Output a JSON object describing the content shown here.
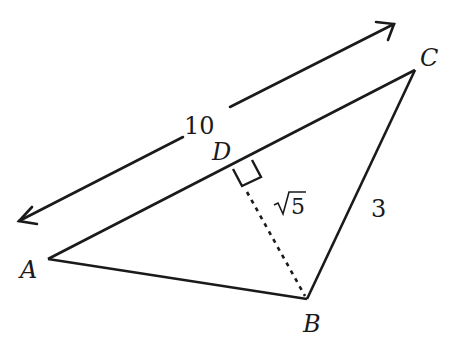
{
  "diagram": {
    "type": "geometry-triangle",
    "colors": {
      "stroke": "#1a1a1a",
      "background": "#ffffff"
    },
    "points": {
      "A": {
        "label": "A",
        "x": 48,
        "y": 259
      },
      "B": {
        "label": "B",
        "x": 307,
        "y": 299
      },
      "C": {
        "label": "C",
        "x": 415,
        "y": 70
      },
      "D": {
        "label": "D",
        "x": 236,
        "y": 167
      }
    },
    "segments": [
      {
        "from": "A",
        "to": "C",
        "style": "solid"
      },
      {
        "from": "A",
        "to": "B",
        "style": "solid"
      },
      {
        "from": "B",
        "to": "C",
        "style": "solid",
        "length_label": "3"
      },
      {
        "from": "B",
        "to": "D",
        "style": "dashed",
        "length_label": "√5"
      }
    ],
    "dimension": {
      "label": "10",
      "measures": "AC",
      "style": "double-arrow"
    },
    "right_angle_at": "D",
    "labels": {
      "A": "A",
      "B": "B",
      "C": "C",
      "D": "D",
      "AC_length": "10",
      "BC_length": "3",
      "BD_length_radical": "√",
      "BD_length_radicand": "5"
    }
  }
}
